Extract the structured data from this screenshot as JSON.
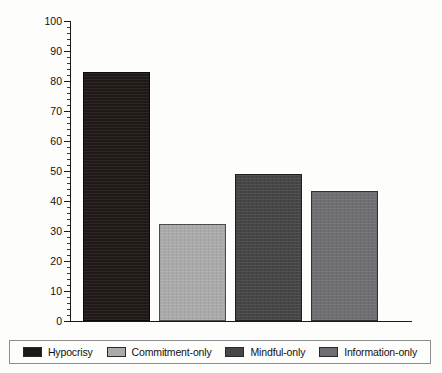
{
  "chart_data": {
    "type": "bar",
    "title": "",
    "xlabel": "",
    "ylabel": "Percentage of subjects who purchased condoms",
    "ylim": [
      0,
      100
    ],
    "ytick_step": 10,
    "yticks": [
      0,
      10,
      20,
      30,
      40,
      50,
      60,
      70,
      80,
      90,
      100
    ],
    "grid": false,
    "legend_position": "bottom",
    "categories": [
      "Hypocrisy",
      "Commitment-only",
      "Mindful-only",
      "Information-only"
    ],
    "values": [
      83,
      32.5,
      49,
      43.5
    ],
    "colors": [
      "#201a17",
      "#aaaaaa",
      "#464646",
      "#6e6e73"
    ],
    "series": [
      {
        "name": "Percentage of subjects who purchased condoms",
        "values": [
          83,
          32.5,
          49,
          43.5
        ]
      }
    ],
    "bars": [
      {
        "label": "Hypocrisy",
        "value": 83,
        "color": "#201a17"
      },
      {
        "label": "Commitment-only",
        "value": 32.5,
        "color": "#aaaaaa"
      },
      {
        "label": "Mindful-only",
        "value": 49,
        "color": "#464646"
      },
      {
        "label": "Information-only",
        "value": 43.5,
        "color": "#6e6e73"
      }
    ]
  },
  "legend": {
    "items": [
      {
        "label": "Hypocrisy",
        "color": "#201a17"
      },
      {
        "label": "Commitment-only",
        "color": "#aaaaaa"
      },
      {
        "label": "Mindful-only",
        "color": "#464646"
      },
      {
        "label": "Information-only",
        "color": "#6e6e73"
      }
    ]
  }
}
